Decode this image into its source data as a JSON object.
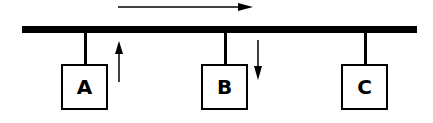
{
  "diagram": {
    "type": "bus-topology",
    "bus": {
      "x1": 22,
      "x2": 417,
      "y": 26,
      "thickness": 7,
      "color": "#000000"
    },
    "flow_arrow": {
      "direction": "right",
      "x1": 118,
      "x2": 252,
      "y": 7
    },
    "nodes": [
      {
        "id": "A",
        "label": "A",
        "x": 61,
        "y": 64,
        "w": 47,
        "h": 46,
        "stem_x": 84
      },
      {
        "id": "B",
        "label": "B",
        "x": 201,
        "y": 64,
        "w": 47,
        "h": 46,
        "stem_x": 224
      },
      {
        "id": "C",
        "label": "C",
        "x": 341,
        "y": 64,
        "w": 47,
        "h": 46,
        "stem_x": 364
      }
    ],
    "node_arrows": [
      {
        "near": "A",
        "direction": "up",
        "x": 119,
        "y1": 82,
        "y2": 41
      },
      {
        "near": "B",
        "direction": "down",
        "x": 258,
        "y1": 40,
        "y2": 80
      }
    ]
  }
}
